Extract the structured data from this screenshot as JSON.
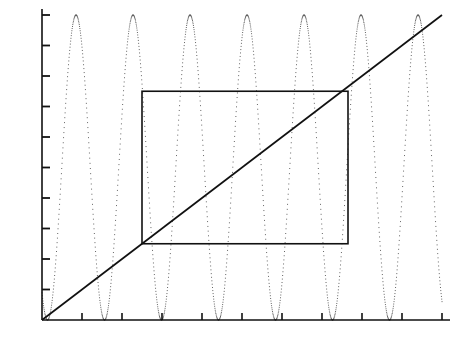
{
  "figure": {
    "width": 466,
    "height": 355,
    "background": "#ffffff",
    "foreground": "#111111"
  },
  "axes": {
    "x_axis_name": "x-axis",
    "y_axis_name": "y-axis",
    "origin_px": {
      "x": 42,
      "y": 320
    },
    "x_px_per_unit": 400,
    "y_px_per_unit": 305,
    "x_tick_labels": [
      "0.1",
      "0.2",
      "0.3",
      "0.4",
      "0.5",
      "0.6",
      "0.7",
      "0.8",
      "0.9",
      "1.0"
    ],
    "x_tick_values": [
      0.1,
      0.2,
      0.3,
      0.4,
      0.5,
      0.6,
      0.7,
      0.8,
      0.9,
      1.0
    ],
    "y_tick_labels": [
      "0.10",
      "0.20",
      "0.30",
      "0.40",
      "0.50",
      "0.60",
      "0.70",
      "0.80",
      "0.90",
      "1.00"
    ],
    "y_tick_values": [
      0.1,
      0.2,
      0.3,
      0.4,
      0.5,
      0.6,
      0.7,
      0.8,
      0.9,
      1.0
    ]
  },
  "chart_data": {
    "type": "line",
    "title": "",
    "subtitle": "",
    "xlabel": "",
    "ylabel": "",
    "xlim": [
      0.0,
      1.0
    ],
    "ylim": [
      0.0,
      1.0
    ],
    "grid": false,
    "legend": null,
    "legend_position": "none",
    "x_ticks": [
      0.1,
      0.2,
      0.3,
      0.4,
      0.5,
      0.6,
      0.7,
      0.8,
      0.9,
      1.0
    ],
    "y_ticks": [
      0.1,
      0.2,
      0.3,
      0.4,
      0.5,
      0.6,
      0.7,
      0.8,
      0.9,
      1.0
    ],
    "x_tick_labels": [
      "0.1",
      "0.2",
      "0.3",
      "0.4",
      "0.5",
      "0.6",
      "0.7",
      "0.8",
      "0.9",
      "1.0"
    ],
    "y_tick_labels": [
      "0.10",
      "0.20",
      "0.30",
      "0.40",
      "0.50",
      "0.60",
      "0.70",
      "0.80",
      "0.90",
      "1.00"
    ],
    "series": [
      {
        "name": "oscillation",
        "style": "dotted",
        "color": "#555555",
        "description": "high-frequency rectified sine, 7 peaks reaching 1.00, touching 0.00 between peaks",
        "formula": "sin(pi*x/0.1425)^2",
        "peak_value": 1.0,
        "trough_value": 0.0,
        "period": 0.1425,
        "peak_x": [
          0.085,
          0.2275,
          0.37,
          0.5125,
          0.655,
          0.7975,
          0.94
        ],
        "zero_x": [
          0.0137,
          0.1562,
          0.2987,
          0.4412,
          0.5837,
          0.7262,
          0.8687
        ]
      },
      {
        "name": "diagonal",
        "style": "solid",
        "color": "#111111",
        "description": "straight identity line from origin to top-right",
        "formula": "y = x",
        "points": [
          [
            0.0,
            0.0
          ],
          [
            1.0,
            1.0
          ]
        ]
      },
      {
        "name": "rectangle",
        "style": "solid",
        "color": "#111111",
        "description": "open rectangle overlay box",
        "x0": 0.25,
        "y0": 0.25,
        "x1": 0.765,
        "y1": 0.75,
        "corners": [
          [
            0.25,
            0.25
          ],
          [
            0.765,
            0.25
          ],
          [
            0.765,
            0.75
          ],
          [
            0.25,
            0.75
          ]
        ]
      }
    ]
  }
}
